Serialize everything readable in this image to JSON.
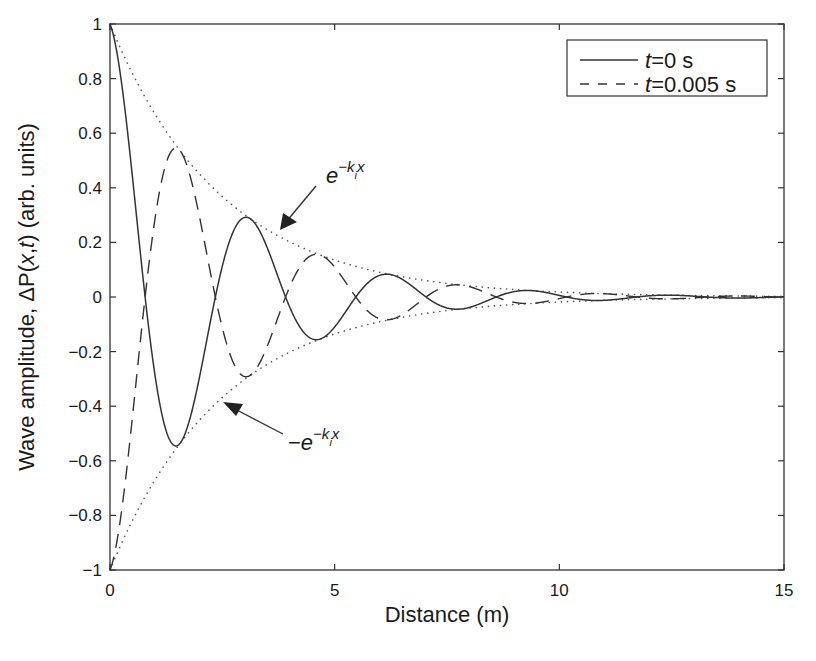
{
  "chart_data": {
    "type": "line",
    "title": "",
    "xlabel": "Distance (m)",
    "ylabel": "Wave amplitude, ΔP(x,t) (arb. units)",
    "xlim": [
      0,
      15
    ],
    "ylim": [
      -1,
      1
    ],
    "xticks": [
      0,
      5,
      10,
      15
    ],
    "xtick_labels": [
      "0",
      "5",
      "10",
      "15"
    ],
    "yticks": [
      1,
      0.8,
      0.6,
      0.4,
      0.2,
      0,
      -0.2,
      -0.4,
      -0.6,
      -0.8,
      -1
    ],
    "ytick_labels": [
      "1",
      "0.8",
      "0.6",
      "0.4",
      "0.2",
      "0",
      "−0.2",
      "−0.4",
      "−0.6",
      "−0.8",
      "−1"
    ],
    "grid": false,
    "legend_position": "upper right",
    "model": {
      "k_r": 2.01,
      "k_i": 0.4,
      "description": "Damped wave: t=0 s is e^(-k_i x) cos(k_r x); t=0.005 s is approximately the negated (phase-shifted by pi) wave; dotted envelopes are +/- e^(-k_i x)"
    },
    "series": [
      {
        "name": "t=0 s",
        "style": "solid",
        "key_points": [
          [
            0,
            1.0
          ],
          [
            0.78,
            0
          ],
          [
            1.45,
            -0.54
          ],
          [
            2.35,
            0
          ],
          [
            3.1,
            0.29
          ],
          [
            3.95,
            0
          ],
          [
            4.6,
            -0.15
          ],
          [
            5.5,
            0
          ],
          [
            6.2,
            0.08
          ],
          [
            7.7,
            -0.045
          ],
          [
            9.3,
            0.025
          ],
          [
            15,
            0
          ]
        ]
      },
      {
        "name": "t=0.005 s",
        "style": "dashed",
        "key_points": [
          [
            0,
            -1.0
          ],
          [
            0.78,
            0
          ],
          [
            1.45,
            0.55
          ],
          [
            2.35,
            0
          ],
          [
            3.1,
            -0.29
          ],
          [
            3.95,
            0
          ],
          [
            4.6,
            0.15
          ],
          [
            6.2,
            -0.08
          ],
          [
            7.7,
            0.045
          ],
          [
            15,
            0
          ]
        ]
      },
      {
        "name": "e^{-k_i x}",
        "style": "dotted",
        "role": "upper envelope"
      },
      {
        "name": "-e^{-k_i x}",
        "style": "dotted",
        "role": "lower envelope"
      }
    ],
    "annotations": [
      {
        "text": "e^{-k_i x}",
        "arrow_to": [
          3.8,
          0.22
        ]
      },
      {
        "text": "-e^{-k_i x}",
        "arrow_to": [
          2.5,
          -0.39
        ]
      }
    ]
  },
  "legend": {
    "items": [
      {
        "t_var": "t",
        "eq": "=0 s",
        "style": "solid"
      },
      {
        "t_var": "t",
        "eq": "=0.005 s",
        "style": "dashed"
      }
    ]
  },
  "annotations": {
    "upper": {
      "base": "e",
      "sup_prefix": "−k",
      "sub": "i",
      "sup_suffix": "x"
    },
    "lower": {
      "minus": "−",
      "base": "e",
      "sup_prefix": "−k",
      "sub": "i",
      "sup_suffix": "x"
    }
  },
  "axes": {
    "xlabel": "Distance (m)",
    "ylabel_prefix": "Wave amplitude, ΔP(",
    "ylabel_x": "x",
    "ylabel_comma": ",",
    "ylabel_t": "t",
    "ylabel_suffix": ") (arb. units)"
  }
}
